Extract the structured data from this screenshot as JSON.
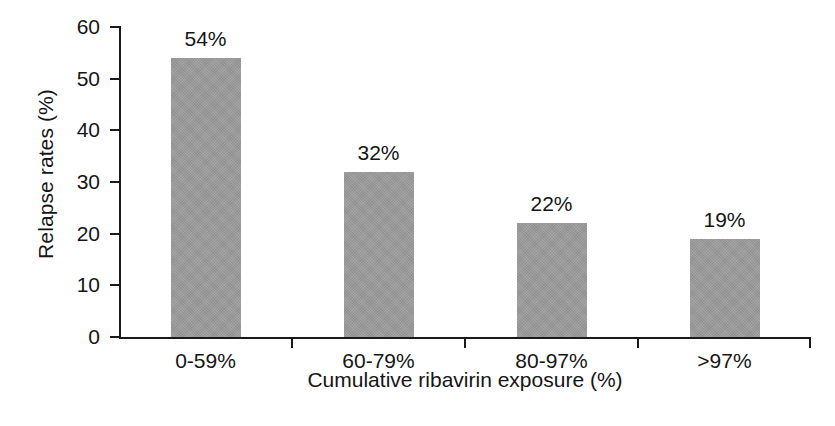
{
  "figure": {
    "background_color": "#ffffff",
    "axis_color": "#1a1a1a",
    "text_color": "#151515",
    "bar_color": "#9a9a9a"
  },
  "chart_data": {
    "type": "bar",
    "title": "",
    "subtitle": "",
    "categories": [
      "0-59%",
      "60-79%",
      "80-97%",
      ">97%"
    ],
    "values": [
      54,
      32,
      22,
      19
    ],
    "value_labels": [
      "54%",
      "32%",
      "22%",
      "19%"
    ],
    "xlabel": "Cumulative ribavirin exposure (%)",
    "ylabel": "Relapse rates (%)",
    "ylim": [
      0,
      60
    ],
    "yticks": [
      0,
      10,
      20,
      30,
      40,
      50,
      60
    ],
    "ytick_labels": [
      "0",
      "10",
      "20",
      "30",
      "40",
      "50",
      "60"
    ],
    "grid": false,
    "legend": null,
    "legend_position": "none",
    "orientation": "vertical",
    "series": [
      {
        "name": "Relapse rate",
        "values": [
          54,
          32,
          22,
          19
        ],
        "color": "#9a9a9a"
      }
    ]
  }
}
